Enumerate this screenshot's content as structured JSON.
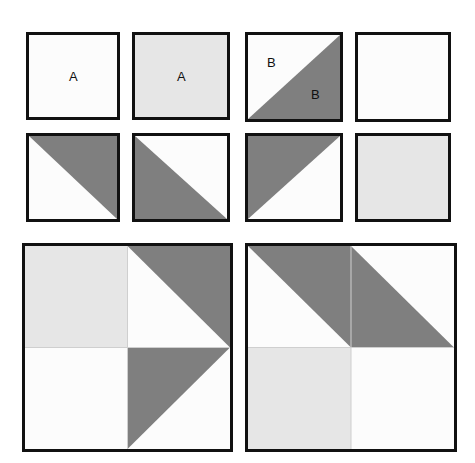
{
  "figure": {
    "title": "",
    "background_color": "#ffffff",
    "border_color": "#111111",
    "colors": {
      "white": "#fcfcfc",
      "light_gray": "#e6e6e6",
      "dark_gray": "#7f7f7f",
      "outline": "#111111",
      "inner_line": "#cfcfcf",
      "text": "#101010"
    }
  },
  "small_tiles": [
    {
      "id": "tile-r1c1",
      "row": 1,
      "col": 1,
      "pattern": "solid",
      "fill": "#fcfcfc",
      "label": "A",
      "label_position": "center",
      "x": 26,
      "y": 32,
      "w": 94,
      "h": 88
    },
    {
      "id": "tile-r1c2",
      "row": 1,
      "col": 2,
      "pattern": "solid",
      "fill": "#e6e6e6",
      "label": "A",
      "label_position": "center",
      "x": 132,
      "y": 32,
      "w": 98,
      "h": 88
    },
    {
      "id": "tile-r1c3",
      "row": 1,
      "col": 3,
      "pattern": "diagonal-tr-bl",
      "fill_upper_left": "#fcfcfc",
      "fill_lower_right": "#7f7f7f",
      "label_upper": "B",
      "label_lower": "B",
      "x": 245,
      "y": 32,
      "w": 98,
      "h": 90
    },
    {
      "id": "tile-r1c4",
      "row": 1,
      "col": 4,
      "pattern": "solid",
      "fill": "#fcfcfc",
      "label": "",
      "x": 355,
      "y": 32,
      "w": 96,
      "h": 90
    },
    {
      "id": "tile-r2c1",
      "row": 2,
      "col": 1,
      "pattern": "diagonal-tl-br-dark-upper",
      "fill_upper_right": "#7f7f7f",
      "fill_lower_left": "#fcfcfc",
      "label": "",
      "x": 26,
      "y": 133,
      "w": 94,
      "h": 89
    },
    {
      "id": "tile-r2c2",
      "row": 2,
      "col": 2,
      "pattern": "diagonal-tl-br-dark-lower",
      "fill_upper_right": "#fcfcfc",
      "fill_lower_left": "#7f7f7f",
      "label": "",
      "x": 132,
      "y": 133,
      "w": 98,
      "h": 89
    },
    {
      "id": "tile-r2c3",
      "row": 2,
      "col": 3,
      "pattern": "diagonal-tr-bl-dark-upper",
      "fill_upper_left": "#7f7f7f",
      "fill_lower_right": "#fcfcfc",
      "label": "",
      "x": 245,
      "y": 133,
      "w": 98,
      "h": 89
    },
    {
      "id": "tile-r2c4",
      "row": 2,
      "col": 4,
      "pattern": "solid",
      "fill": "#e6e6e6",
      "label": "",
      "x": 355,
      "y": 133,
      "w": 96,
      "h": 89
    }
  ],
  "large_tiles": [
    {
      "id": "composite-left",
      "x": 22,
      "y": 243,
      "w": 211,
      "h": 209,
      "quadrants": [
        {
          "position": "top-left",
          "pattern": "solid",
          "fill": "#e6e6e6"
        },
        {
          "position": "top-right",
          "pattern": "triangle-upper-right",
          "fill": "#7f7f7f",
          "base": "#fcfcfc"
        },
        {
          "position": "bottom-left",
          "pattern": "solid",
          "fill": "#fcfcfc"
        },
        {
          "position": "bottom-right",
          "pattern": "triangle-upper-left",
          "fill": "#7f7f7f",
          "base": "#fcfcfc"
        }
      ]
    },
    {
      "id": "composite-right",
      "x": 245,
      "y": 243,
      "w": 212,
      "h": 209,
      "quadrants": [
        {
          "position": "top-left",
          "pattern": "triangle-upper-right",
          "fill": "#7f7f7f",
          "base": "#fcfcfc"
        },
        {
          "position": "top-right",
          "pattern": "triangle-lower-left",
          "fill": "#7f7f7f",
          "base": "#fcfcfc"
        },
        {
          "position": "bottom-left",
          "pattern": "solid",
          "fill": "#e6e6e6"
        },
        {
          "position": "bottom-right",
          "pattern": "solid",
          "fill": "#fcfcfc"
        }
      ]
    }
  ],
  "labels": {
    "a1": "A",
    "a2": "A",
    "b_upper": "B",
    "b_lower": "B"
  }
}
